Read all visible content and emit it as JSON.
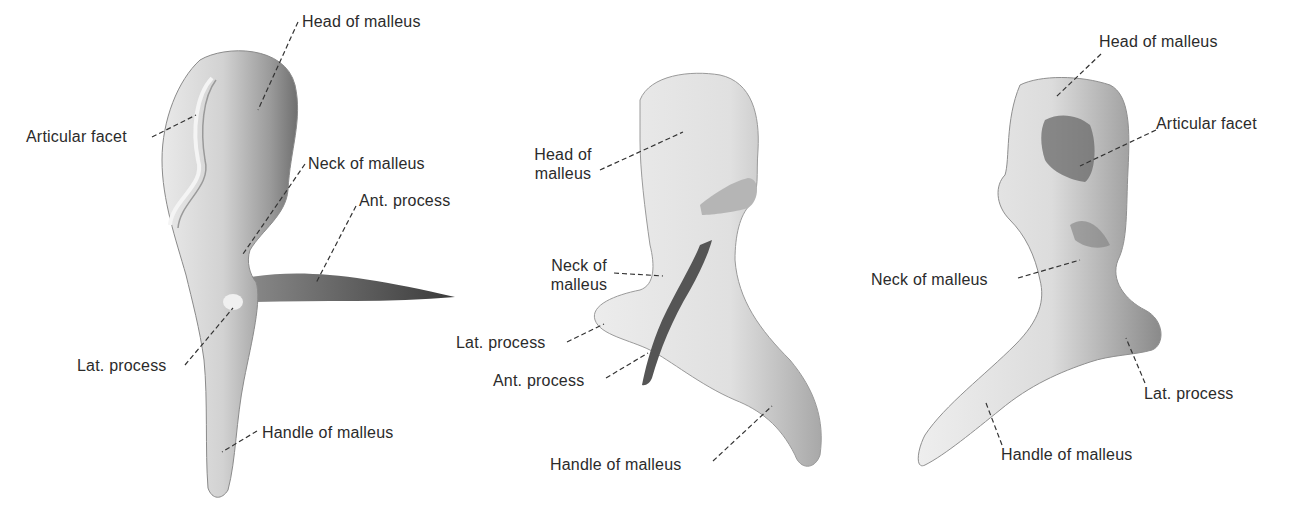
{
  "figure": {
    "views": [
      {
        "id": "view-1",
        "labels": {
          "head": "Head of malleus",
          "articular_facet": "Articular facet",
          "neck": "Neck of malleus",
          "ant_process": "Ant. process",
          "lat_process": "Lat. process",
          "handle": "Handle of malleus"
        }
      },
      {
        "id": "view-2",
        "labels": {
          "head_line1": "Head of",
          "head_line2": "malleus",
          "neck_line1": "Neck of",
          "neck_line2": "malleus",
          "lat_process": "Lat. process",
          "ant_process": "Ant. process",
          "handle": "Handle of malleus"
        }
      },
      {
        "id": "view-3",
        "labels": {
          "head": "Head of malleus",
          "articular_facet": "Articular facet",
          "neck": "Neck of malleus",
          "lat_process": "Lat. process",
          "handle": "Handle of malleus"
        }
      }
    ],
    "colors": {
      "background": "#ffffff",
      "text": "#2b2b2b",
      "leader": "#333333",
      "bone_light": "#f2f2f2",
      "bone_mid": "#c8c8c8",
      "bone_dark": "#6e6e6e"
    }
  }
}
